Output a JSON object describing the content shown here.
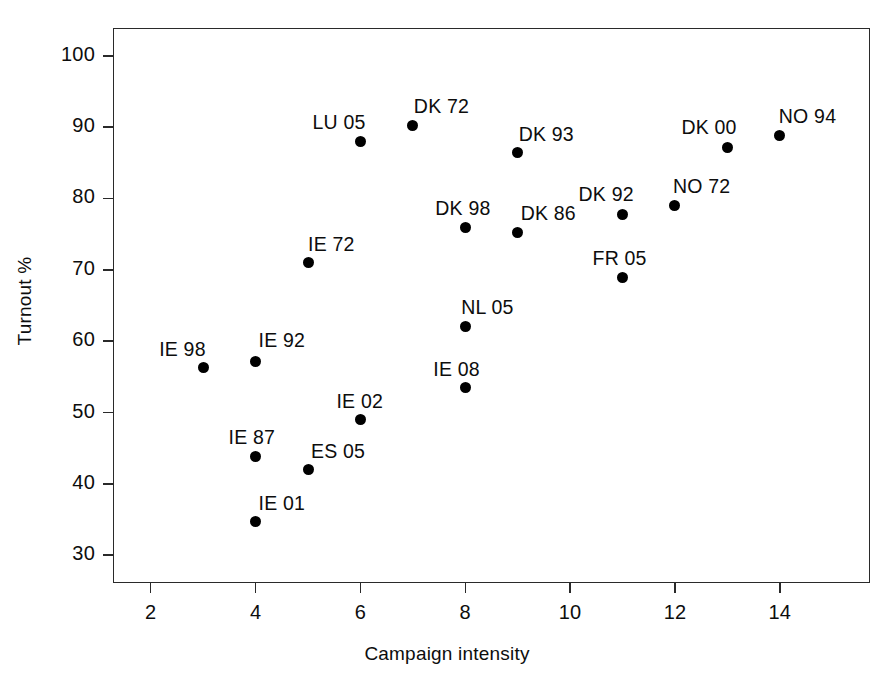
{
  "chart_data": {
    "type": "scatter",
    "title": "",
    "xlabel": "Campaign intensity",
    "ylabel": "Turnout %",
    "xlim": [
      1.28,
      15.72
    ],
    "ylim": [
      26.1,
      103.9
    ],
    "xticks": [
      2,
      4,
      6,
      8,
      10,
      12,
      14
    ],
    "xtick_labels": [
      "2",
      "4",
      "6",
      "8",
      "10",
      "12",
      "14"
    ],
    "yticks": [
      30,
      40,
      50,
      60,
      70,
      80,
      90,
      100
    ],
    "ytick_labels": [
      "30",
      "40",
      "50",
      "60",
      "70",
      "80",
      "90",
      "100"
    ],
    "grid": false,
    "legend": null,
    "marker": "filled-circle",
    "marker_color": "#000000",
    "points": [
      {
        "label": "IE 98",
        "x": 3,
        "y": 56.3,
        "label_dx": -44,
        "label_dy": -30
      },
      {
        "label": "IE 92",
        "x": 4,
        "y": 57.2,
        "label_dx": 3,
        "label_dy": -32
      },
      {
        "label": "IE 01",
        "x": 4,
        "y": 34.7,
        "label_dx": 3,
        "label_dy": -30
      },
      {
        "label": "IE 87",
        "x": 4,
        "y": 43.9,
        "label_dx": -27,
        "label_dy": -30
      },
      {
        "label": "ES 05",
        "x": 5,
        "y": 42.0,
        "label_dx": 3,
        "label_dy": -30
      },
      {
        "label": "IE 72",
        "x": 5,
        "y": 71.0,
        "label_dx": 0,
        "label_dy": -30
      },
      {
        "label": "IE 02",
        "x": 6,
        "y": 49.0,
        "label_dx": -24,
        "label_dy": -30
      },
      {
        "label": "LU 05",
        "x": 6,
        "y": 88.0,
        "label_dx": -48,
        "label_dy": -30
      },
      {
        "label": "DK 72",
        "x": 7,
        "y": 90.3,
        "label_dx": 1,
        "label_dy": -30
      },
      {
        "label": "DK 98",
        "x": 8,
        "y": 76.0,
        "label_dx": -30,
        "label_dy": -30
      },
      {
        "label": "NL 05",
        "x": 8,
        "y": 62.0,
        "label_dx": -4,
        "label_dy": -31
      },
      {
        "label": "IE 08",
        "x": 8,
        "y": 53.5,
        "label_dx": -32,
        "label_dy": -30
      },
      {
        "label": "DK 93",
        "x": 9,
        "y": 86.4,
        "label_dx": 1,
        "label_dy": -30
      },
      {
        "label": "DK 86",
        "x": 9,
        "y": 75.3,
        "label_dx": 3,
        "label_dy": -30
      },
      {
        "label": "DK 92",
        "x": 11,
        "y": 77.8,
        "label_dx": -44,
        "label_dy": -31
      },
      {
        "label": "FR 05",
        "x": 11,
        "y": 68.9,
        "label_dx": -30,
        "label_dy": -31
      },
      {
        "label": "NO 72",
        "x": 12,
        "y": 79.0,
        "label_dx": -2,
        "label_dy": -31
      },
      {
        "label": "DK 00",
        "x": 13,
        "y": 87.2,
        "label_dx": -46,
        "label_dy": -31
      },
      {
        "label": "NO 94",
        "x": 14,
        "y": 88.8,
        "label_dx": -1,
        "label_dy": -31
      }
    ]
  }
}
